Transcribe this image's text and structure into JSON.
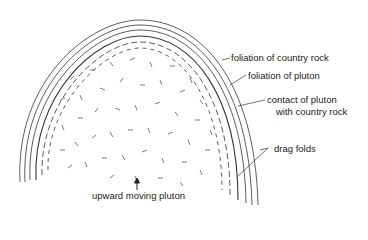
{
  "diagram": {
    "labels": {
      "foliation_country_rock": "foliation of country rock",
      "foliation_pluton": "foliation of pluton",
      "contact_line1": "contact of pluton",
      "contact_line2": "with country rock",
      "drag_folds": "drag folds",
      "upward_moving_pluton": "upward moving pluton"
    },
    "colors": {
      "ink": "#222222",
      "background": "#ffffff"
    }
  }
}
